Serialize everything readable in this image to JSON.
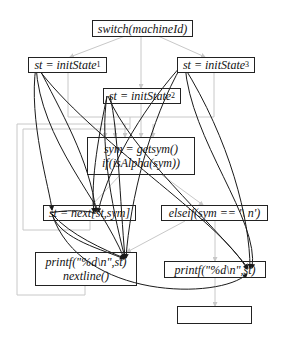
{
  "diagram": {
    "type": "control-flow-graph",
    "nodes": [
      {
        "id": "switch",
        "lines": [
          "switch(machineId)"
        ]
      },
      {
        "id": "init1",
        "text": "st = initState",
        "sub": "1"
      },
      {
        "id": "init2",
        "text": "st = initState",
        "sub": "2"
      },
      {
        "id": "init3",
        "text": "st = initState",
        "sub": "3"
      },
      {
        "id": "getsym",
        "lines": [
          "sym = getsym()",
          "if(isAlpha(sym))"
        ]
      },
      {
        "id": "next",
        "lines": [
          "st = next[st,sym]"
        ]
      },
      {
        "id": "elseif",
        "lines": [
          "elseif(sym == '\\ n')"
        ]
      },
      {
        "id": "printf_left",
        "lines": [
          "printf(\"%d\\n\",st)",
          "nextline()"
        ]
      },
      {
        "id": "printf_right",
        "lines": [
          "printf(\"%d\\n\",st)"
        ]
      },
      {
        "id": "exit",
        "lines": [
          ""
        ]
      }
    ],
    "colors": {
      "control_edge": "#c8c8c8",
      "data_edge": "#1a1a1a",
      "node_border": "#222222"
    }
  }
}
